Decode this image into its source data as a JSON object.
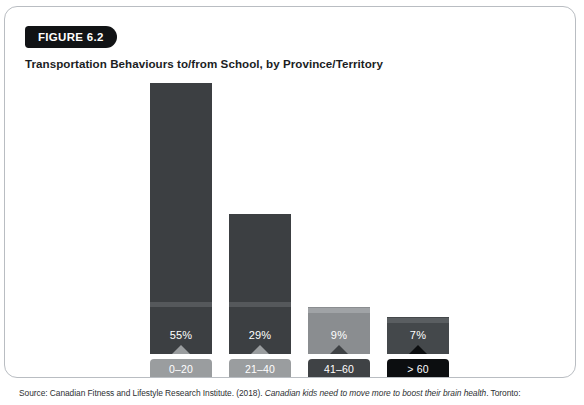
{
  "figure": {
    "badge": "FIGURE 6.2",
    "title": "Transportation Behaviours to/from School, by Province/Territory",
    "source_prefix": "Source: Canadian Fitness and Lifestyle Research Institute. (2018). ",
    "source_italic": "Canadian kids need to move more to boost their brain health",
    "source_suffix": ". Toronto:"
  },
  "colors": {
    "badge_bg": "#111315",
    "bar_1": "#3c3f42",
    "bar_2": "#3c3f42",
    "bar_3": "#8a8d90",
    "bar_4": "#44484b",
    "band_1": "#55585b",
    "band_2": "#55585b",
    "band_3": "#a0a3a6",
    "band_4": "#5a5e61",
    "chip_1": "#9a9d9f",
    "chip_2": "#9a9d9f",
    "chip_3": "#3f4245",
    "chip_4": "#0c0e10",
    "card_border": "#b9bdc2",
    "text_light": "#ffffff"
  },
  "chart_data": {
    "type": "bar",
    "title": "Transportation Behaviours to/from School, by Province/Territory",
    "xlabel": "",
    "ylabel": "",
    "ylim": [
      0,
      60
    ],
    "grid": false,
    "legend": "none",
    "categories": [
      "0–20 MINS",
      "21–40 MINS",
      "41–60 MINS",
      "> 60 MINS"
    ],
    "values": [
      55,
      29,
      9,
      7
    ],
    "data_labels": [
      "55%",
      "29%",
      "9%",
      "7%"
    ],
    "bars": [
      {
        "index": 0,
        "label_line1": "0–20",
        "label_line2": "MINS",
        "value": 55,
        "data_label": "55%",
        "bar_color": "#3c3f42",
        "band_color": "#55585b",
        "chip_color": "#9a9d9f",
        "left": 145,
        "top": 76,
        "width": 62,
        "height": 271
      },
      {
        "index": 1,
        "label_line1": "21–40",
        "label_line2": "MINS",
        "value": 29,
        "data_label": "29%",
        "bar_color": "#3c3f42",
        "band_color": "#55585b",
        "chip_color": "#9a9d9f",
        "left": 224,
        "top": 207,
        "width": 62,
        "height": 140
      },
      {
        "index": 2,
        "label_line1": "41–60",
        "label_line2": "MINS",
        "value": 9,
        "data_label": "9%",
        "bar_color": "#8a8d90",
        "band_color": "#a0a3a6",
        "chip_color": "#3f4245",
        "left": 303,
        "top": 300,
        "width": 62,
        "height": 47
      },
      {
        "index": 3,
        "label_line1": "> 60",
        "label_line2": "MINS",
        "value": 7,
        "data_label": "7%",
        "bar_color": "#44484b",
        "band_color": "#5a5e61",
        "chip_color": "#0c0e10",
        "left": 382,
        "top": 310,
        "width": 62,
        "height": 37
      }
    ]
  }
}
